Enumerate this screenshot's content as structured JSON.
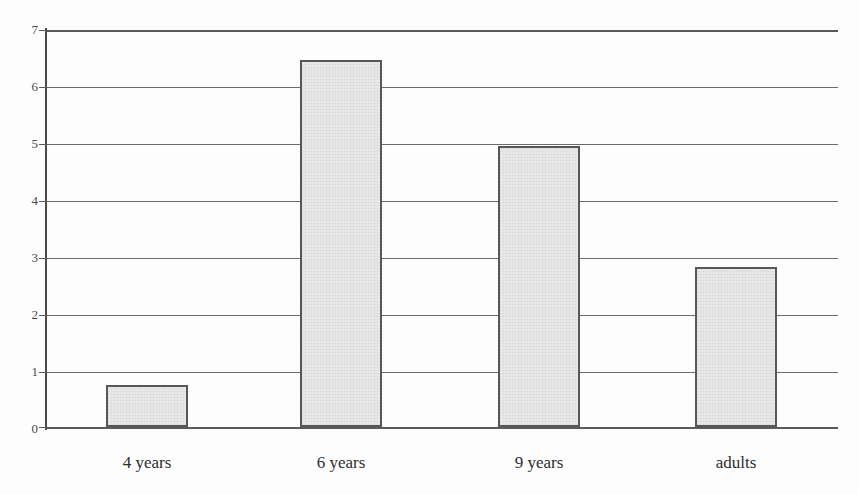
{
  "chart_data": {
    "type": "bar",
    "title": "",
    "subtitle": "",
    "xlabel": "",
    "ylabel": "",
    "categories": [
      "4 years",
      "6 years",
      "9 years",
      "adults"
    ],
    "values": [
      0.75,
      6.48,
      4.95,
      2.82
    ],
    "series": [
      {
        "name": "",
        "values": [
          0.75,
          6.48,
          4.95,
          2.82
        ]
      }
    ],
    "ylim": [
      0,
      7
    ],
    "xlim": [
      0,
      4
    ],
    "y_ticks": [
      "0",
      "1",
      "2",
      "3",
      "4",
      "5",
      "6",
      "7"
    ],
    "y_tick_values": [
      0,
      1,
      2,
      3,
      4,
      5,
      6,
      7
    ],
    "grid": true,
    "grid_axis": "y",
    "legend": false,
    "legend_position": "none",
    "annotations": [],
    "colors": {
      "bar_fill": "#e9e9e9",
      "bar_border": "#575757",
      "gridline": "#6b6b6b",
      "axis": "#4a4a4a",
      "background": "#fdfdfd",
      "label_text": "#2e2e2e",
      "tick_text": "#4a4a4a"
    }
  }
}
